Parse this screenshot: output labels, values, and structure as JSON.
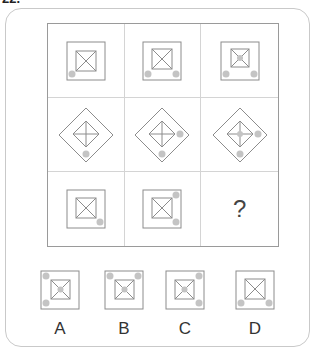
{
  "question_number": "22.",
  "colors": {
    "line": "#8c8c8c",
    "dot": "#c4c4c4",
    "grid_border": "#9a9a9a",
    "frame": "#c9c9c9"
  },
  "puzzle": {
    "rows": [
      {
        "shape": "square",
        "cells": [
          {
            "dots": [
              "bottom-left"
            ],
            "center_dot": false
          },
          {
            "dots": [
              "bottom-left",
              "bottom-right"
            ],
            "center_dot": false
          },
          {
            "dots": [
              "bottom-left",
              "bottom-right"
            ],
            "center_dot": true
          }
        ]
      },
      {
        "shape": "diamond",
        "cells": [
          {
            "dots": [
              "bottom"
            ],
            "center_dot": false
          },
          {
            "dots": [
              "bottom",
              "right"
            ],
            "center_dot": false
          },
          {
            "dots": [
              "bottom",
              "right"
            ],
            "center_dot": true
          }
        ]
      },
      {
        "shape": "square",
        "cells": [
          {
            "dots": [
              "bottom-right"
            ],
            "center_dot": false
          },
          {
            "dots": [
              "top-right",
              "bottom-right"
            ],
            "center_dot": false
          },
          {
            "missing": true,
            "label": "?"
          }
        ]
      }
    ]
  },
  "options": [
    {
      "label": "A",
      "dots": [
        "top-left",
        "bottom-left"
      ],
      "center_dot": true
    },
    {
      "label": "B",
      "dots": [
        "top-left",
        "top-right"
      ],
      "center_dot": true
    },
    {
      "label": "C",
      "dots": [
        "top-right",
        "bottom-right"
      ],
      "center_dot": true
    },
    {
      "label": "D",
      "dots": [
        "bottom-left",
        "bottom-right"
      ],
      "center_dot": false
    }
  ]
}
